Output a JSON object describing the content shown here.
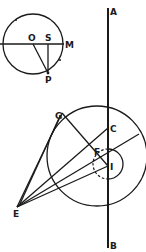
{
  "diagram": {
    "type": "geometric figure",
    "colors": {
      "ink": "#1a1a1a",
      "background": "#ffffff"
    },
    "labels": {
      "A": "A",
      "B": "B",
      "O": "O",
      "S": "S",
      "M": "M",
      "P": "P",
      "G": "G",
      "C": "C",
      "F": "F",
      "I": "I",
      "E": "E"
    },
    "elements": [
      "vertical line AB",
      "upper circle centered at O with diameter through S to M",
      "segments OP and SP",
      "large circle crossing line AB at C",
      "small circle centered at I, left half dashed",
      "lines from E to G, C, F, I and tangent rays"
    ]
  }
}
